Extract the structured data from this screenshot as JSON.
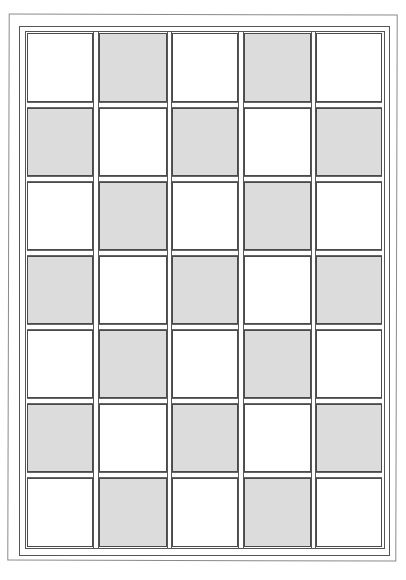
{
  "diagram": {
    "type": "checkerboard-grid",
    "rows": 7,
    "columns": 5,
    "colors": {
      "filled": "#dcdcdc",
      "empty": "#ffffff",
      "line": "#4a4a4a",
      "outer_line": "#8a8a8a"
    },
    "column_x": [
      27,
      99,
      172,
      244,
      316
    ],
    "column_w": [
      66,
      68,
      66,
      67,
      66
    ],
    "row_y": [
      33,
      108,
      182,
      256,
      330,
      404,
      478
    ],
    "row_h": [
      69,
      68,
      68,
      68,
      68,
      68,
      69
    ],
    "pattern": [
      [
        0,
        1,
        0,
        1,
        0
      ],
      [
        1,
        0,
        1,
        0,
        1
      ],
      [
        0,
        1,
        0,
        1,
        0
      ],
      [
        1,
        0,
        1,
        0,
        1
      ],
      [
        0,
        1,
        0,
        1,
        0
      ],
      [
        1,
        0,
        1,
        0,
        1
      ],
      [
        0,
        1,
        0,
        1,
        0
      ]
    ]
  }
}
